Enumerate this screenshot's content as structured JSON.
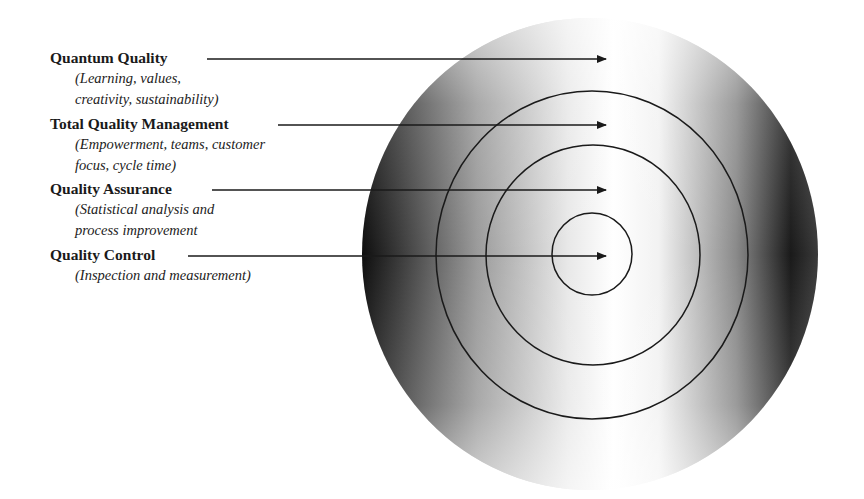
{
  "diagram": {
    "type": "concentric-target",
    "colors": {
      "background": "#ffffff",
      "ink": "#1a1a1a",
      "gradient_dark": "#1c1c1c",
      "gradient_light": "#ffffff"
    },
    "levels": [
      {
        "title": "Quantum Quality",
        "description_lines": [
          "(Learning, values,",
          "creativity, sustainability)"
        ]
      },
      {
        "title": "Total Quality Management",
        "description_lines": [
          "(Empowerment, teams, customer",
          "focus, cycle time)"
        ]
      },
      {
        "title": "Quality Assurance",
        "description_lines": [
          "(Statistical analysis and",
          "process improvement"
        ]
      },
      {
        "title": "Quality Control",
        "description_lines": [
          "(Inspection and measurement)"
        ]
      }
    ]
  }
}
